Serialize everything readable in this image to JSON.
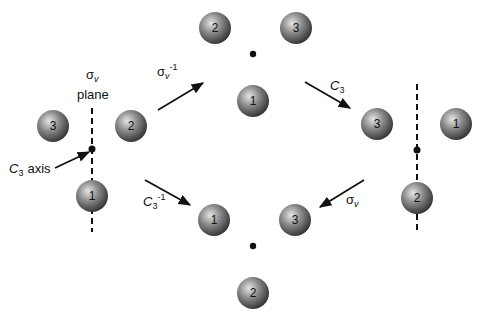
{
  "diagram": {
    "colors": {
      "sphere_light": "#d9d9d9",
      "sphere_dark": "#3a3a3a",
      "line": "#111111"
    },
    "labels": {
      "sigma_v_plane_symbol": "σ",
      "sigma_v_plane_sub": "v",
      "plane_word": "plane",
      "c3_axis_C": "C",
      "c3_axis_sub": "3",
      "c3_axis_word": "axis",
      "op_sigma_inv_symbol": "σ",
      "op_sigma_inv_sub": "v",
      "op_sigma_inv_sup": "-1",
      "op_c3_C": "C",
      "op_c3_sub": "3",
      "op_c3_inv_C": "C",
      "op_c3_inv_sub": "3",
      "op_c3_inv_sup": "-1",
      "op_sigma_symbol": "σ",
      "op_sigma_sub": "v"
    },
    "configs": {
      "left": {
        "atoms": [
          "3",
          "2",
          "1"
        ]
      },
      "top": {
        "atoms": [
          "2",
          "3",
          "1"
        ]
      },
      "right": {
        "atoms": [
          "3",
          "1",
          "2"
        ]
      },
      "bottom": {
        "atoms": [
          "1",
          "3",
          "2"
        ]
      }
    }
  }
}
